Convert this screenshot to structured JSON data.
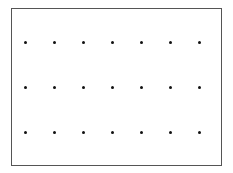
{
  "diagram": {
    "type": "dot-grid",
    "rows": 3,
    "columns": 7,
    "frame_color": "#555555",
    "dot_color": "#111111",
    "dot_x": [
      25,
      54,
      83,
      112,
      141,
      170,
      199
    ],
    "dot_y": [
      42,
      87,
      132
    ]
  }
}
